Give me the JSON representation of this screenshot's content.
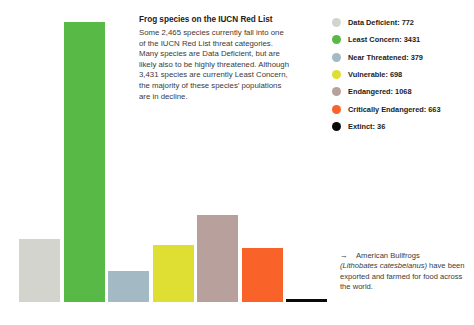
{
  "chart_data": {
    "type": "bar",
    "title": "Frog species on the IUCN Red List",
    "xlabel": "",
    "ylabel": "",
    "ylim": [
      0,
      3431
    ],
    "grid": false,
    "legend_position": "right",
    "categories": [
      "Data Deficient",
      "Least Concern",
      "Near Threatened",
      "Vulnerable",
      "Endangered",
      "Critically Endangered",
      "Extinct"
    ],
    "values": [
      772,
      3431,
      379,
      698,
      1068,
      663,
      36
    ],
    "colors": [
      "#d4d4cf",
      "#58b947",
      "#a3b9c4",
      "#dede33",
      "#b8a09c",
      "#f9632a",
      "#0a0a0a"
    ],
    "annotations": [
      "American Bullfrogs (Lithobates catesbeianus) have been exported and farmed for food across the world."
    ]
  },
  "body": {
    "title": "Frog species on the IUCN Red List",
    "description": "Some 2,465 species currently fall into one of the IUCN Red List threat categories. Many species are Data Deficient, but are likely also to be highly threatened. Although 3,431 species are currently Least Concern, the majority of these species’ populations are in decline."
  },
  "legend": {
    "items": [
      {
        "label": "Data Deficient: 772",
        "color": "#d4d4cf"
      },
      {
        "label": "Least Concern: 3431",
        "color": "#58b947"
      },
      {
        "label": "Near Threatened: 379",
        "color": "#a3b9c4"
      },
      {
        "label": "Vulnerable: 698",
        "color": "#dede33"
      },
      {
        "label": "Endangered: 1068",
        "color": "#b8a09c"
      },
      {
        "label": "Critically Endangered: 663",
        "color": "#f9632a"
      },
      {
        "label": "Extinct: 36",
        "color": "#0a0a0a"
      }
    ]
  },
  "annotation": {
    "arrow": "→",
    "line1": "American Bullfrogs",
    "species": "(Lithobates catesbeianus)",
    "rest": " have been exported and farmed for food across the world."
  }
}
